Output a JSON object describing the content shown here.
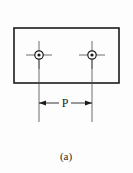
{
  "figure": {
    "caption": "(a)",
    "dimension_label": "P",
    "background_color": "#fdfdfd",
    "line_color": "#1b1b1b",
    "centerline_color": "#4a4a4a",
    "plate": {
      "name": "rectangular-plate",
      "x": 14,
      "y": 28,
      "width": 105,
      "height": 55,
      "stroke_width": 1.6
    },
    "holes": [
      {
        "name": "hole-left",
        "cx": 39,
        "cy": 55,
        "outer_radius": 4.2,
        "inner_radius": 1.6,
        "centerline_h_half": 13,
        "centerline_v_half": 14
      },
      {
        "name": "hole-right",
        "cx": 92,
        "cy": 55,
        "outer_radius": 4.2,
        "inner_radius": 1.6,
        "centerline_h_half": 13,
        "centerline_v_half": 14
      }
    ],
    "dimension": {
      "name": "pitch-dimension",
      "label": "P",
      "line_y": 103,
      "x_start": 39,
      "x_end": 92,
      "label_x": 65,
      "label_y": 107,
      "extension_line_top": 55,
      "extension_line_bottom": 122,
      "arrow_length": 7,
      "arrow_half_height": 2.4
    },
    "caption_position": {
      "x": 66,
      "y": 160
    }
  }
}
